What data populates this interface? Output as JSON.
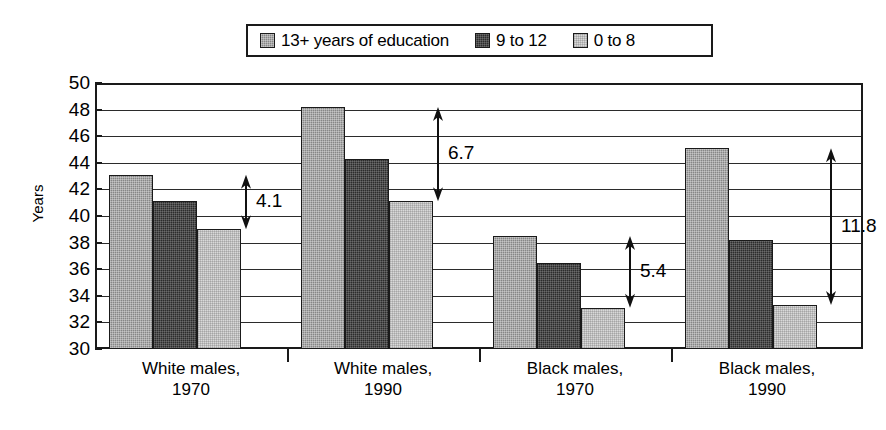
{
  "chart_data": {
    "type": "bar",
    "title": "",
    "subtitle": "",
    "xlabel": "",
    "ylabel": "Years",
    "ylim": [
      30,
      50
    ],
    "ytick_step": 2,
    "yticks": [
      50,
      48,
      46,
      44,
      42,
      40,
      38,
      36,
      34,
      32,
      30
    ],
    "grid": true,
    "legend_position": "top-center",
    "categories": [
      "White males, 1970",
      "White males, 1990",
      "Black males, 1970",
      "Black males, 1990"
    ],
    "category_lines": [
      [
        "White males,",
        "1970"
      ],
      [
        "White males,",
        "1990"
      ],
      [
        "Black males,",
        "1970"
      ],
      [
        "Black males,",
        "1990"
      ]
    ],
    "series": [
      {
        "name": "13+ years of education",
        "color": "#868686",
        "values": [
          43.1,
          48.2,
          38.5,
          45.1
        ]
      },
      {
        "name": "9 to 12",
        "color": "#2c2c2c",
        "values": [
          41.1,
          44.3,
          36.5,
          38.2
        ]
      },
      {
        "name": "0 to 8",
        "color": "#d9d9d9",
        "values": [
          39.0,
          41.1,
          33.1,
          33.3
        ]
      }
    ],
    "annotations": [
      {
        "label": "4.1",
        "group": 0,
        "from": 39.0,
        "to": 43.1
      },
      {
        "label": "6.7",
        "group": 1,
        "from": 41.1,
        "to": 48.2
      },
      {
        "label": "5.4",
        "group": 2,
        "from": 33.1,
        "to": 38.5
      },
      {
        "label": "11.8",
        "group": 3,
        "from": 33.3,
        "to": 45.1
      }
    ]
  },
  "legend": {
    "items": [
      {
        "label": "13+ years of education"
      },
      {
        "label": "9 to 12"
      },
      {
        "label": "0 to 8"
      }
    ]
  },
  "axis": {
    "y_title": "Years"
  }
}
